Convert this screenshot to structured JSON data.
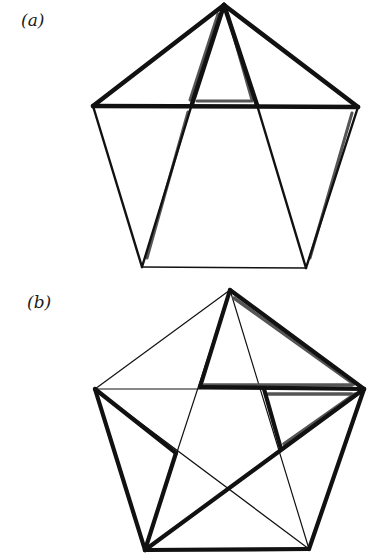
{
  "figure": {
    "panels": [
      {
        "id": "a",
        "label": "(a)",
        "description": "Regular pentagon decomposed into triangles by two diagonals from the apex and the horizontal diagonal; all triangles outlined thick with grey inner shading",
        "vertices": {
          "apex": [
            224,
            5
          ],
          "left": [
            93,
            106
          ],
          "right": [
            358,
            107
          ],
          "bottom_left": [
            142,
            267
          ],
          "bottom_right": [
            306,
            268
          ]
        },
        "intersections": {
          "left_on_horizontal": [
            192,
            104
          ],
          "right_on_horizontal": [
            257,
            105
          ]
        }
      },
      {
        "id": "b",
        "label": "(b)",
        "description": "Regular pentagon with all five diagonals (pentagram); selected triangles outlined thick with grey inner shading",
        "vertices": {
          "apex": [
            230,
            290
          ],
          "left": [
            95,
            389
          ],
          "right": [
            364,
            389
          ],
          "bottom_left": [
            145,
            550
          ],
          "bottom_right": [
            309,
            549
          ]
        },
        "intersections": {
          "top_left": [
            200,
            387
          ],
          "top_right": [
            264,
            389
          ],
          "left": [
            176,
            453
          ],
          "right": [
            281,
            449
          ],
          "bottom": [
            229,
            497
          ]
        }
      }
    ]
  },
  "colors": {
    "stroke": "#111111",
    "shade": "#555555",
    "background": "#ffffff"
  }
}
